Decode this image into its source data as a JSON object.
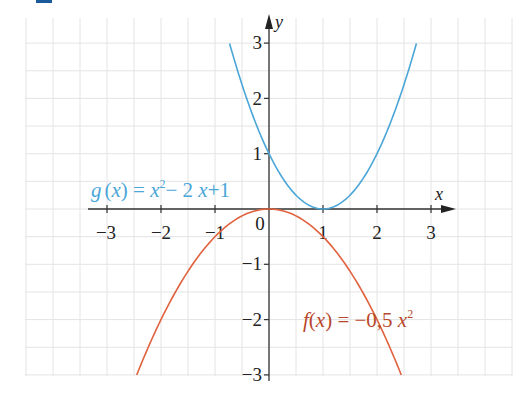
{
  "chart_data": {
    "type": "line",
    "title": "",
    "xlabel": "x",
    "ylabel": "y",
    "xlim": [
      -3,
      3
    ],
    "ylim": [
      -3,
      3
    ],
    "x_ticks": [
      "−3",
      "−2",
      "−1",
      "0",
      "1",
      "2",
      "3"
    ],
    "y_ticks": [
      "3",
      "2",
      "1",
      "−1",
      "−2",
      "−3"
    ],
    "grid": true,
    "grid_step": 0.5,
    "legend": null,
    "series": [
      {
        "name": "g(x) = x² − 2x + 1",
        "label_parts": [
          "g",
          "(",
          "x",
          ")",
          " = ",
          "x",
          "2",
          "− 2 ",
          "x",
          "+1"
        ],
        "color": "#4ba6d8",
        "x": [
          -0.73,
          -0.5,
          0,
          0.5,
          1,
          1.5,
          2,
          2.5,
          2.73
        ],
        "values": [
          3.0,
          2.25,
          1,
          0.25,
          0,
          0.25,
          1,
          2.25,
          3.0
        ]
      },
      {
        "name": "f(x) = −0,5 x²",
        "color": "#e0623e",
        "x": [
          -2.45,
          -2,
          -1.5,
          -1,
          -0.5,
          0,
          0.5,
          1,
          1.5,
          2,
          2.45
        ],
        "values": [
          -3.0,
          -2,
          -1.125,
          -0.5,
          -0.125,
          0,
          -0.125,
          -0.5,
          -1.125,
          -2,
          -3.0
        ]
      }
    ],
    "annotations": [
      {
        "text": "g(x) = x² − 2x + 1",
        "near": [
          -3.2,
          0.3
        ],
        "color": "#4ba6d8"
      },
      {
        "text": "f(x) = −0,5 x²",
        "near": [
          0.6,
          -1.9
        ],
        "color": "#e0623e"
      }
    ]
  },
  "labels": {
    "x_axis": "x",
    "y_axis": "y",
    "ticks_x": {
      "m3": "−3",
      "m2": "−2",
      "m1": "−1",
      "zero": "0",
      "p1": "1",
      "p2": "2",
      "p3": "3"
    },
    "ticks_y": {
      "p3": "3",
      "p2": "2",
      "p1": "1",
      "m1": "−1",
      "m2": "−2",
      "m3": "−3"
    },
    "g": {
      "name": "g",
      "open": "(",
      "var": "x",
      "close": ")",
      "eq": " = ",
      "x1": "x",
      "sup": "2",
      "mid": "− 2 ",
      "x2": "x",
      "tail": "+1"
    },
    "f": {
      "name": "f",
      "open": "(",
      "var": "x",
      "close": ")",
      "eq": " = ",
      "coef": "−0,5 ",
      "x1": "x",
      "sup": "2"
    }
  },
  "colors": {
    "g_curve": "#4ba6d8",
    "f_curve": "#e0623e",
    "axis": "#333333",
    "grid": "#e4e4e4",
    "corner_tab": "#1a5a9a"
  }
}
